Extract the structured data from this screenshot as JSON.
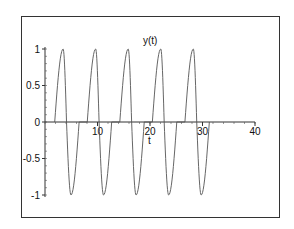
{
  "chart_data": {
    "type": "line",
    "title": "",
    "xlabel": "t",
    "ylabel": "y(t)",
    "xlim": [
      0,
      40
    ],
    "ylim": [
      -1,
      1
    ],
    "x_ticks": [
      10,
      20,
      30,
      40
    ],
    "x_tick_labels": [
      "10",
      "20",
      "30",
      "40"
    ],
    "y_ticks": [
      -1,
      -0.5,
      0,
      0.5,
      1
    ],
    "y_tick_labels": [
      "-1",
      "-0.5",
      "0",
      "0.5",
      "1"
    ],
    "grid": false,
    "legend": null,
    "series": [
      {
        "name": "y(t)",
        "color": "#555555",
        "description": "Five periodic oscillation spikes between -1 and 1, starting near t=1.85 with period about 6.2, ending near t=31.",
        "cycle_start_t": 1.85,
        "period": 6.2,
        "cycles": 5,
        "cycle_shape_offsets": {
          "start": 0,
          "peak": 1.6,
          "zero_cross": 2.25,
          "trough": 3.1,
          "end": 4.65
        },
        "peaks_t": [
          3.45,
          9.65,
          15.85,
          22.05,
          28.25
        ],
        "troughs_t": [
          4.95,
          11.15,
          17.35,
          23.55,
          29.75
        ],
        "peak_value": 1,
        "trough_value": -1
      }
    ]
  }
}
